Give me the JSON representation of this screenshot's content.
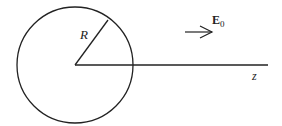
{
  "diagram": {
    "labels": {
      "radius": "R",
      "field": "E",
      "field_sub": "0",
      "axis": "z"
    },
    "colors": {
      "stroke": "#222222",
      "background": "#ffffff"
    }
  }
}
